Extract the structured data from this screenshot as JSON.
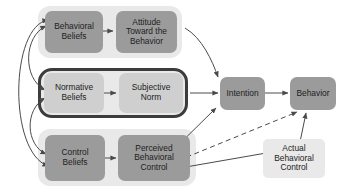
{
  "diagram": {
    "colors": {
      "canvas_background": "#ffffff",
      "node_fill": "#9b9b9b",
      "node_fill_light": "#cfcfcf",
      "group_background": "#e9e9e9",
      "frame_border": "#3c3c3c",
      "arrow": "#4a4a4a",
      "text": "#1d1d1d"
    },
    "nodes": [
      {
        "id": "behavioral-beliefs",
        "label": "Behavioral\nBeliefs"
      },
      {
        "id": "attitude-toward-the-behavior",
        "label": "Attitude\nToward the\nBehavior"
      },
      {
        "id": "normative-beliefs",
        "label": "Normative\nBeliefs"
      },
      {
        "id": "subjective-norm",
        "label": "Subjective\nNorm"
      },
      {
        "id": "control-beliefs",
        "label": "Control\nBeliefs"
      },
      {
        "id": "perceived-behavioral-control",
        "label": "Perceived\nBehavioral\nControl"
      },
      {
        "id": "intention",
        "label": "Intention"
      },
      {
        "id": "behavior",
        "label": "Behavior"
      },
      {
        "id": "actual-behavioral-control",
        "label": "Actual\nBehavioral\nControl"
      }
    ],
    "edges": [
      {
        "id": "behavioral-beliefs-to-attitude",
        "style": "solid",
        "direction": "one-way"
      },
      {
        "id": "normative-beliefs-to-subjective-norm",
        "style": "solid",
        "direction": "one-way"
      },
      {
        "id": "control-beliefs-to-perceived-behavioral-control",
        "style": "solid",
        "direction": "one-way"
      },
      {
        "id": "attitude-to-intention",
        "style": "solid",
        "direction": "one-way"
      },
      {
        "id": "subjective-norm-to-intention",
        "style": "solid",
        "direction": "one-way"
      },
      {
        "id": "perceived-behavioral-control-to-intention",
        "style": "solid",
        "direction": "one-way"
      },
      {
        "id": "intention-to-behavior",
        "style": "solid",
        "direction": "one-way"
      },
      {
        "id": "perceived-behavioral-control-to-behavior",
        "style": "dashed",
        "direction": "one-way"
      },
      {
        "id": "actual-behavioral-control-to-behavior",
        "style": "solid",
        "direction": "one-way"
      },
      {
        "id": "actual-behavioral-control-to-perceived-behavioral-control",
        "style": "solid",
        "direction": "one-way"
      },
      {
        "id": "behavioral-beliefs-to-normative-beliefs",
        "style": "solid",
        "direction": "two-way"
      },
      {
        "id": "normative-beliefs-to-control-beliefs",
        "style": "solid",
        "direction": "two-way"
      },
      {
        "id": "behavioral-beliefs-to-control-beliefs",
        "style": "solid",
        "direction": "two-way"
      }
    ]
  }
}
